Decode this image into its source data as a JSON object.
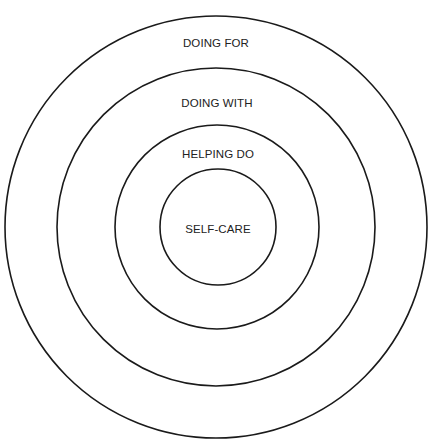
{
  "diagram": {
    "type": "concentric-circles",
    "center": {
      "x": 216,
      "y": 227
    },
    "stroke_color": "#1a1a1a",
    "rings": [
      {
        "label": "DOING FOR",
        "radius": 211,
        "label_y": 38
      },
      {
        "label": "DOING WITH",
        "radius": 159,
        "label_y": 98
      },
      {
        "label": "HELPING DO",
        "radius": 102,
        "label_y": 149
      },
      {
        "label": "SELF-CARE",
        "radius": 58,
        "label_y": 224
      }
    ]
  }
}
